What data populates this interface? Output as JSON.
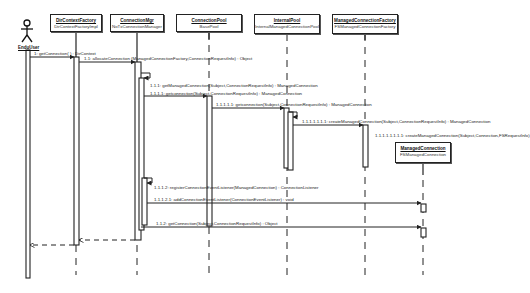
{
  "diagram": {
    "type": "UML sequence diagram",
    "actor": {
      "name": "EnduUser",
      "icon": "stick-figure-icon"
    },
    "objects": [
      {
        "name": "DirContextFactory",
        "class": "DirContextFactoryImpl"
      },
      {
        "name": "ConnectionMgr",
        "class": "NoTxConnectionManager"
      },
      {
        "name": "ConnectionPool",
        "class": "BasePool"
      },
      {
        "name": "InternalPool",
        "class": "InternalManagedConnectionPool"
      },
      {
        "name": "ManagedConnectionFactory",
        "class": "FSManagedConnectionFactory"
      },
      {
        "name": "ManagedConnection",
        "class": "FSManagedConnection"
      }
    ],
    "messages": [
      {
        "label": "1: getConnection( ) : DirContext"
      },
      {
        "label": "1.1: allocateConnection (ManagedConnectionFactory,ConnectionRequestInfo) : Object"
      },
      {
        "label": "1.1.1: getManagedConnection(Subject,ConnectionRequestInfo) : ManagedConnection"
      },
      {
        "label": "1.1.1.1: getconnection(Subject,ConnectionRequestInfo) : ManagedConnection"
      },
      {
        "label": "1.1.1.1.1: getconnection(Subject,ConnectionRequestInfo) : ManagedConnection"
      },
      {
        "label": "1.1.1.1.1.1.1: createManagedConnection(Subject,ConnectionRequestInfo) : ManagedConnection"
      },
      {
        "label": "1.1.1.1.1.1.1.1: createManagedConnection(Subject,Connection,FSRequestInfo)"
      },
      {
        "label": "1.1.1.2: registerConnectionEventListener(ManagedConnection) : ConnectionListener"
      },
      {
        "label": "1.1.1.2.1: addConnectionEventListener(ConnectionEventListener) : void"
      },
      {
        "label": "1.1.2: getConnection(Subject,ConnectionRequestInfo) : Object"
      }
    ]
  }
}
